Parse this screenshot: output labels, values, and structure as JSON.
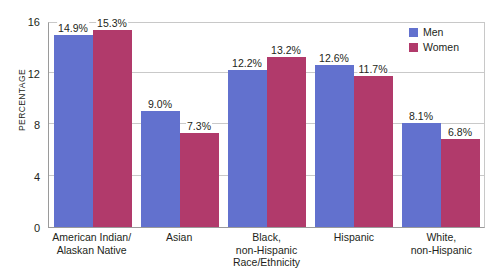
{
  "chart_data": {
    "type": "bar",
    "title": "",
    "xlabel": "Race/Ethnicity",
    "ylabel": "PERCENTAGE",
    "ylim": [
      0,
      16
    ],
    "yticks": [
      0,
      4,
      8,
      12,
      16
    ],
    "grid": true,
    "legend_position": "top-right",
    "categories": [
      "American Indian/\nAlaskan Native",
      "Asian",
      "Black,\nnon-Hispanic",
      "Hispanic",
      "White,\nnon-Hispanic"
    ],
    "category_lines": [
      [
        "American Indian/",
        "Alaskan Native"
      ],
      [
        "Asian"
      ],
      [
        "Black,",
        "non-Hispanic"
      ],
      [
        "Hispanic"
      ],
      [
        "White,",
        "non-Hispanic"
      ]
    ],
    "series": [
      {
        "name": "Men",
        "color": "#6271ce",
        "values": [
          14.9,
          9.0,
          12.2,
          12.6,
          8.1
        ],
        "labels": [
          "14.9%",
          "9.0%",
          "12.2%",
          "12.6%",
          "8.1%"
        ]
      },
      {
        "name": "Women",
        "color": "#b13a6b",
        "values": [
          15.3,
          7.3,
          13.2,
          11.7,
          6.8
        ],
        "labels": [
          "15.3%",
          "7.3%",
          "13.2%",
          "11.7%",
          "6.8%"
        ]
      }
    ]
  },
  "axis": {
    "y_title": "PERCENTAGE",
    "x_title": "Race/Ethnicity",
    "y_tick_labels": [
      "16",
      "12",
      "8",
      "4",
      "0"
    ]
  },
  "legend": {
    "items": [
      {
        "label": "Men",
        "color": "#6271ce"
      },
      {
        "label": "Women",
        "color": "#b13a6b"
      }
    ]
  }
}
